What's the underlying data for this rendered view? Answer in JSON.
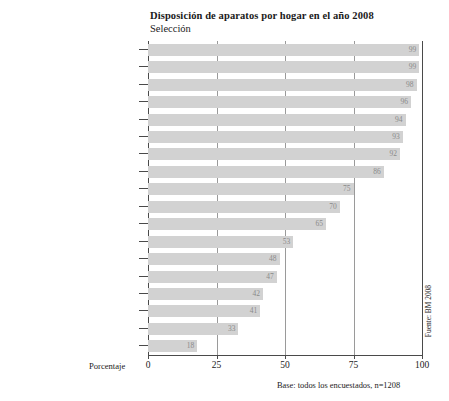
{
  "chart_data": {
    "type": "bar",
    "orientation": "horizontal",
    "title": "Disposición de aparatos por hogar en el año 2008",
    "subtitle": "Selección",
    "xlabel": "Porcentaje",
    "ylabel": "",
    "xlim": [
      0,
      100
    ],
    "xticks": [
      0,
      25,
      50,
      75,
      100
    ],
    "grid": "vertical",
    "legend": "none",
    "categories": [
      "Teléfono celular",
      "Computador/Laptop",
      "Televisor",
      "Acceso a Internet",
      "Reproductor de CD",
      "Reproductor de MP3/iPod",
      "Cámara digital",
      "Reproductor de DVD (no PC)",
      "Videograbadora",
      "Grabadora",
      "Consola de juegos fija (TV/PC)",
      "Consola de juegos portátil",
      "Walkman/Discman",
      "Tocadiscos",
      "Grabador de DVD",
      "Televisor pantalla plana",
      "Teléfono celular UMTS",
      "Grabador de mini disc"
    ],
    "values": [
      99,
      99,
      98,
      96,
      94,
      93,
      92,
      86,
      75,
      70,
      65,
      53,
      48,
      47,
      42,
      41,
      33,
      18
    ],
    "italic_categories": [
      "Walkman/Discman"
    ],
    "bar_color": "#d2d2d2",
    "value_label_color": "#8a8a8a",
    "base_note": "Base: todos los encuestados, n=1208",
    "source_note": "Fuente: BM 2008"
  }
}
